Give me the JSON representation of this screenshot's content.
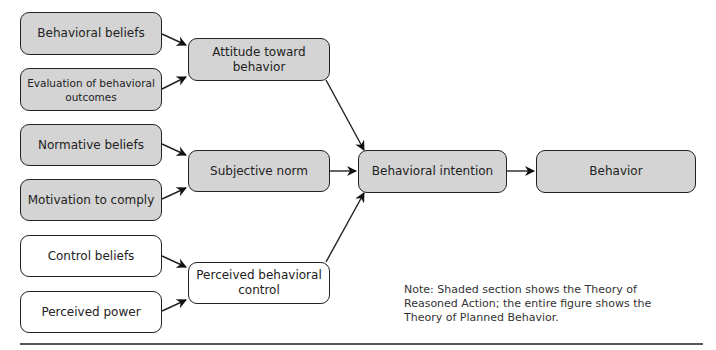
{
  "diagram": {
    "inputs": [
      {
        "label": "Behavioral beliefs",
        "shaded": true
      },
      {
        "label": "Evaluation of behavioral outcomes",
        "shaded": true
      },
      {
        "label": "Normative beliefs",
        "shaded": true
      },
      {
        "label": "Motivation to comply",
        "shaded": true
      },
      {
        "label": "Control beliefs",
        "shaded": false
      },
      {
        "label": "Perceived power",
        "shaded": false
      }
    ],
    "constructs": [
      {
        "label": "Attitude toward behavior",
        "shaded": true
      },
      {
        "label": "Subjective norm",
        "shaded": true
      },
      {
        "label": "Perceived behavioral control",
        "shaded": false
      }
    ],
    "intention": {
      "label": "Behavioral intention"
    },
    "behavior": {
      "label": "Behavior"
    },
    "note": "Note: Shaded section shows the Theory of Reasoned Action; the entire figure shows the Theory of Planned Behavior.",
    "colors": {
      "shaded_fill": "#d4d4d4",
      "border": "#222222",
      "rule": "#555555"
    }
  }
}
